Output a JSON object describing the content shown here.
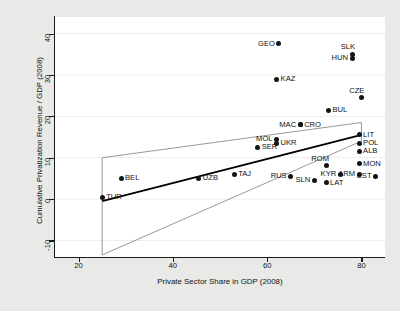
{
  "chart_data": {
    "type": "scatter",
    "title": "",
    "xlabel": "Private Sector Share in GDP (2008)",
    "ylabel": "Cumulative Privatization Revenue / GDP (2008)",
    "xlim": [
      15,
      85
    ],
    "ylim": [
      -14,
      44
    ],
    "xticks": [
      20,
      40,
      60,
      80
    ],
    "yticks": [
      -10,
      0,
      10,
      20,
      30,
      40
    ],
    "grid": true,
    "legend": "none",
    "point_color": "#141414",
    "fit_line_color": "#000000",
    "band_color": "#8c8c8c",
    "points": [
      {
        "label": "GEO",
        "x": 62.5,
        "y": 37.5,
        "label_side": "left"
      },
      {
        "label": "SLK",
        "x": 78.0,
        "y": 35.0,
        "label_side": "above"
      },
      {
        "label": "HUN",
        "x": 78.0,
        "y": 34.0,
        "label_side": "left"
      },
      {
        "label": "KAZ",
        "x": 62.0,
        "y": 29.0,
        "label_side": "right"
      },
      {
        "label": "CZE",
        "x": 80.0,
        "y": 24.5,
        "label_side": "above"
      },
      {
        "label": "BUL",
        "x": 73.0,
        "y": 21.5,
        "label_side": "right"
      },
      {
        "label": "CRO",
        "x": 67.0,
        "y": 18.0,
        "label_side": "right"
      },
      {
        "label": "MAC",
        "x": 67.0,
        "y": 18.0,
        "label_side": "left"
      },
      {
        "label": "LIT",
        "x": 79.5,
        "y": 15.5,
        "label_side": "right"
      },
      {
        "label": "MOL",
        "x": 62.0,
        "y": 14.5,
        "label_side": "left"
      },
      {
        "label": "UKR",
        "x": 62.0,
        "y": 13.5,
        "label_side": "right"
      },
      {
        "label": "POL",
        "x": 79.5,
        "y": 13.5,
        "label_side": "right"
      },
      {
        "label": "SER",
        "x": 58.0,
        "y": 12.5,
        "label_side": "right"
      },
      {
        "label": "ALB",
        "x": 79.5,
        "y": 11.5,
        "label_side": "right"
      },
      {
        "label": "MON",
        "x": 79.5,
        "y": 8.5,
        "label_side": "right"
      },
      {
        "label": "ROM",
        "x": 72.5,
        "y": 8.0,
        "label_side": "above"
      },
      {
        "label": "ARM",
        "x": 79.5,
        "y": 6.0,
        "label_side": "left"
      },
      {
        "label": "EST",
        "x": 83.0,
        "y": 5.5,
        "label_side": "left"
      },
      {
        "label": "KYR",
        "x": 75.5,
        "y": 6.0,
        "label_side": "left"
      },
      {
        "label": "TAJ",
        "x": 53.0,
        "y": 6.0,
        "label_side": "right"
      },
      {
        "label": "RUS",
        "x": 65.0,
        "y": 5.5,
        "label_side": "left"
      },
      {
        "label": "SLN",
        "x": 70.0,
        "y": 4.5,
        "label_side": "left"
      },
      {
        "label": "LAT",
        "x": 72.5,
        "y": 4.0,
        "label_side": "right"
      },
      {
        "label": "BEL",
        "x": 29.0,
        "y": 5.0,
        "label_side": "right"
      },
      {
        "label": "UZB",
        "x": 45.5,
        "y": 5.0,
        "label_side": "right"
      },
      {
        "label": "TUR",
        "x": 25.0,
        "y": 0.5,
        "label_side": "right"
      }
    ],
    "fit_line": {
      "x1": 25.0,
      "y1": -0.5,
      "x2": 80.0,
      "y2": 15.5
    },
    "confidence_band": {
      "upper": [
        [
          25.0,
          10.0
        ],
        [
          80.0,
          18.5
        ]
      ],
      "lower": [
        [
          25.0,
          -13.5
        ],
        [
          80.0,
          14.0
        ]
      ],
      "right_edge_x": 80.0
    }
  }
}
